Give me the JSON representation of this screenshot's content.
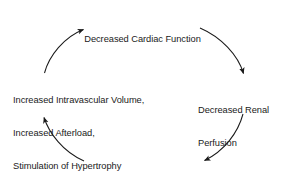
{
  "diagram": {
    "type": "cycle",
    "background_color": "#ffffff",
    "stroke_color": "#1a1a1a",
    "text_color": "#1a1a1a",
    "nodes": [
      {
        "id": "decreased-cardiac-function",
        "position": "top",
        "lines": [
          "Decreased Cardiac Function"
        ]
      },
      {
        "id": "decreased-renal-perfusion",
        "position": "right",
        "lines": [
          "Decreased Renal",
          "Perfusion"
        ]
      },
      {
        "id": "increased-renin-and-aldosterone",
        "position": "bottom",
        "lines": [
          "Increased Renin and Aldosterone"
        ]
      },
      {
        "id": "increased-intravascular-volume",
        "position": "left",
        "lines": [
          "Increased Intravascular Volume,",
          "Increased Afterload,",
          "Stimulation of Hypertrophy"
        ]
      }
    ],
    "arrows": [
      {
        "id": "arrow-top-right",
        "from": "decreased-cardiac-function",
        "to": "decreased-renal-perfusion",
        "direction": "clockwise-down-right"
      },
      {
        "id": "arrow-bottom-right",
        "from": "decreased-renal-perfusion",
        "to": "increased-renin-and-aldosterone",
        "direction": "clockwise-down-left"
      },
      {
        "id": "arrow-bottom-left",
        "from": "increased-renin-and-aldosterone",
        "to": "increased-intravascular-volume",
        "direction": "clockwise-up-left"
      },
      {
        "id": "arrow-top-left",
        "from": "increased-intravascular-volume",
        "to": "decreased-cardiac-function",
        "direction": "clockwise-up-right"
      }
    ]
  }
}
